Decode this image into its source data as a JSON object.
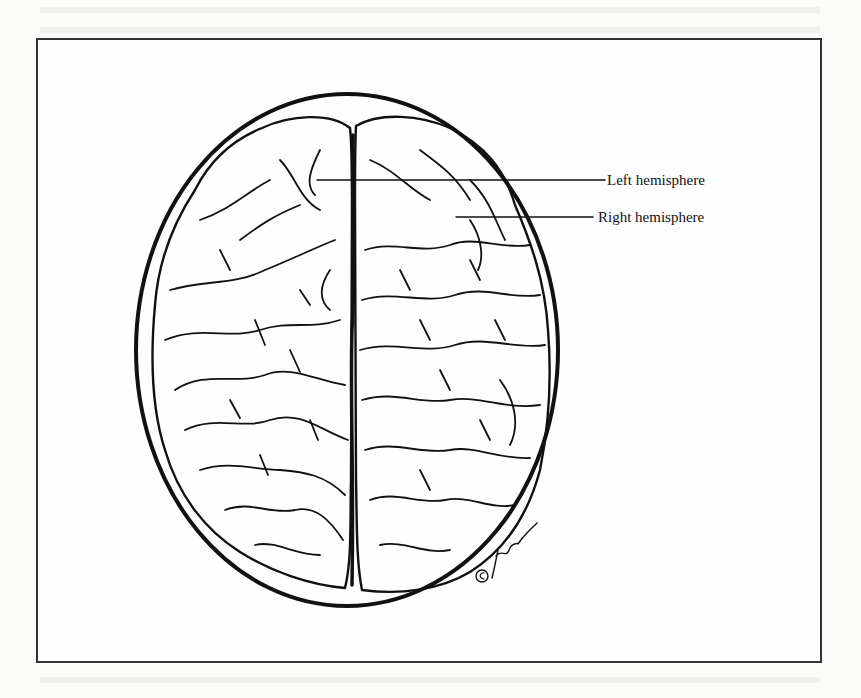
{
  "figure": {
    "labels": [
      {
        "id": "left",
        "text": "Left hemisphere",
        "x": 607,
        "y": 173
      },
      {
        "id": "right",
        "text": "Right hemisphere",
        "x": 598,
        "y": 210
      }
    ],
    "copyright_mark": "©",
    "signature": "artist signature",
    "colors": {
      "ink": "#111111",
      "paper": "#fbfbfa",
      "frame": "#333333"
    }
  }
}
